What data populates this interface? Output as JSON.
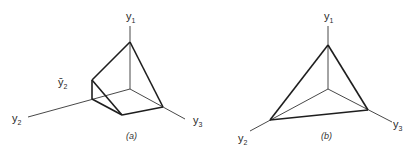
{
  "figure": {
    "panels": [
      {
        "id": "a",
        "caption": "(a)",
        "axes": {
          "y1": {
            "label": "y",
            "sub": "1"
          },
          "y2": {
            "label": "y",
            "sub": "2"
          },
          "y3": {
            "label": "y",
            "sub": "3"
          }
        },
        "annotation": {
          "label": "ȳ",
          "sub": "2"
        }
      },
      {
        "id": "b",
        "caption": "(b)",
        "axes": {
          "y1": {
            "label": "y",
            "sub": "1"
          },
          "y2": {
            "label": "y",
            "sub": "2"
          },
          "y3": {
            "label": "y",
            "sub": "3"
          }
        }
      }
    ]
  }
}
